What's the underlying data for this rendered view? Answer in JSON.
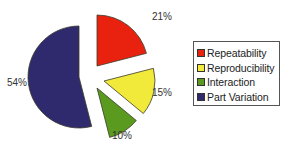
{
  "chart_data": {
    "type": "pie",
    "title": "",
    "categories": [
      "Repeatability",
      "Reproducibility",
      "Interaction",
      "Part Variation"
    ],
    "values": [
      21,
      15,
      10,
      54
    ],
    "labels": [
      "21%",
      "15%",
      "10%",
      "54%"
    ],
    "colors": [
      "#e8220f",
      "#f2ea3a",
      "#5a9a1e",
      "#2f2a6e"
    ],
    "edge_color": "#3a3a2a",
    "exploded": true,
    "start_angle": "12 o'clock, clockwise",
    "legend_position": "right"
  },
  "legend": {
    "items": [
      {
        "label": "Repeatability",
        "color": "#e8220f"
      },
      {
        "label": "Reproducibility",
        "color": "#f2ea3a"
      },
      {
        "label": "Interaction",
        "color": "#5a9a1e"
      },
      {
        "label": "Part Variation",
        "color": "#2f2a6e"
      }
    ]
  },
  "layout": {
    "center": [
      86,
      76
    ],
    "radius": 51,
    "explode": [
      {
        "dx": 11,
        "dy": -10
      },
      {
        "dx": 18,
        "dy": 5
      },
      {
        "dx": 11,
        "dy": 12
      },
      {
        "dx": -7,
        "dy": 1
      }
    ],
    "label_pos": [
      {
        "x": 152,
        "y": 20
      },
      {
        "x": 152,
        "y": 96
      },
      {
        "x": 112,
        "y": 139
      },
      {
        "x": 7,
        "y": 86
      }
    ]
  }
}
